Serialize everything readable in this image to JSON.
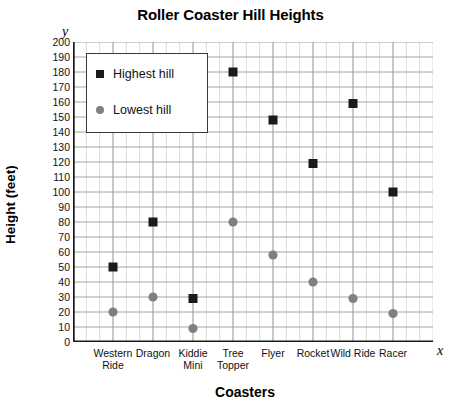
{
  "chart_data": {
    "type": "scatter",
    "title": "Roller Coaster Hill Heights",
    "xlabel": "Coasters",
    "ylabel": "Height (feet)",
    "x_axis_letter": "x",
    "y_axis_letter": "y",
    "categories": [
      "Western Ride",
      "Dragon",
      "Kiddie Mini",
      "Tree Topper",
      "Flyer",
      "Rocket",
      "Wild Ride",
      "Racer"
    ],
    "category_lines": [
      [
        "Western",
        "Ride"
      ],
      [
        "Dragon"
      ],
      [
        "Kiddie",
        "Mini"
      ],
      [
        "Tree",
        "Topper"
      ],
      [
        "Flyer"
      ],
      [
        "Rocket"
      ],
      [
        "Wild Ride"
      ],
      [
        "Racer"
      ]
    ],
    "ylim": [
      0,
      200
    ],
    "ytick_step": 10,
    "yticks": [
      0,
      10,
      20,
      30,
      40,
      50,
      60,
      70,
      80,
      90,
      100,
      110,
      120,
      130,
      140,
      150,
      160,
      170,
      180,
      190,
      200
    ],
    "grid": true,
    "legend_position": "top-left",
    "series": [
      {
        "name": "Highest hill",
        "marker": "square",
        "color": "#1a1a1a",
        "values": [
          50,
          80,
          29,
          180,
          148,
          119,
          159,
          100
        ]
      },
      {
        "name": "Lowest hill",
        "marker": "circle",
        "color": "#808080",
        "values": [
          20,
          30,
          9,
          80,
          58,
          40,
          29,
          19
        ]
      }
    ]
  },
  "legend": {
    "items": [
      {
        "label": "Highest hill",
        "marker": "square-marker-icon"
      },
      {
        "label": "Lowest hill",
        "marker": "circle-marker-icon"
      }
    ]
  },
  "colors": {
    "highest_hill": "#1a1a1a",
    "lowest_hill": "#808080",
    "grid_major": "#9a9a9a",
    "grid_minor": "#d2d2d2",
    "axis": "#1a1a1a"
  }
}
